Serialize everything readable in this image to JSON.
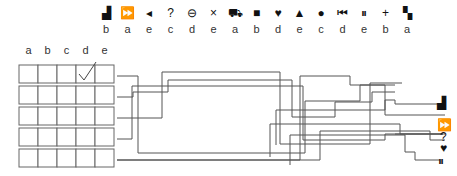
{
  "legend": [
    {
      "icon": "factory-icon",
      "glyph": "▟",
      "letter": "b"
    },
    {
      "icon": "fast-forward-icon",
      "glyph": "⏩",
      "letter": "a"
    },
    {
      "icon": "triangle-left-icon",
      "glyph": "◂",
      "letter": "e"
    },
    {
      "icon": "question-icon",
      "glyph": "?",
      "letter": "c"
    },
    {
      "icon": "circle-minus-icon",
      "glyph": "⊖",
      "letter": "d"
    },
    {
      "icon": "times-icon",
      "glyph": "×",
      "letter": "e"
    },
    {
      "icon": "bus-icon",
      "glyph": "⛟",
      "letter": "a"
    },
    {
      "icon": "square-icon",
      "glyph": "■",
      "letter": "b"
    },
    {
      "icon": "heart-icon",
      "glyph": "♥",
      "letter": "d"
    },
    {
      "icon": "triangle-up-icon",
      "glyph": "▲",
      "letter": "e"
    },
    {
      "icon": "circle-icon",
      "glyph": "●",
      "letter": "c"
    },
    {
      "icon": "skip-back-icon",
      "glyph": "⏮",
      "letter": "d"
    },
    {
      "icon": "pause-icon",
      "glyph": "⏸",
      "letter": "e"
    },
    {
      "icon": "plus-icon",
      "glyph": "+",
      "letter": "b"
    },
    {
      "icon": "checker-icon",
      "glyph": "▚",
      "letter": "a"
    }
  ],
  "grid": {
    "columns": [
      "a",
      "b",
      "c",
      "d",
      "e"
    ],
    "rows": 5,
    "checked": [
      {
        "row": 0,
        "col": 3
      }
    ]
  },
  "outputs": [
    {
      "icon": "factory-icon",
      "glyph": "▟"
    },
    {
      "icon": "fast-forward-icon",
      "glyph": "⏩"
    },
    {
      "icon": "question-icon",
      "glyph": "?"
    },
    {
      "icon": "heart-icon",
      "glyph": "♥"
    },
    {
      "icon": "pause-icon",
      "glyph": "⏸"
    }
  ]
}
